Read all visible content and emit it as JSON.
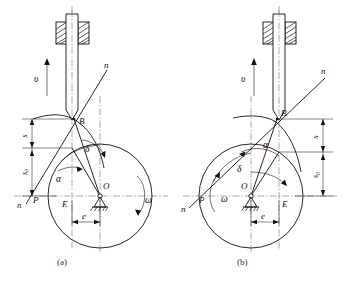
{
  "figure": {
    "background": "#ffffff",
    "line_color": "#111111",
    "centerline_color": "#555555"
  },
  "captions": {
    "a": "(a)",
    "b": "(b)"
  },
  "panels": [
    {
      "id": "a",
      "caption": "(a)",
      "offset_side": "left",
      "rotation_label": "ω",
      "rotation_direction": "clockwise",
      "labels": {
        "velocity": "υ",
        "normal_upper": "n",
        "normal_lower": "n",
        "contact_point": "B",
        "pitch_point": "P",
        "foot_point": "E",
        "center": "O",
        "eccentricity": "e",
        "pressure_angle": "α",
        "cam_angle": "δ",
        "displacement": "s",
        "initial_displacement": "s₀",
        "omega": "ω"
      }
    },
    {
      "id": "b",
      "caption": "(b)",
      "offset_side": "right",
      "rotation_label": "ω",
      "rotation_direction": "counterclockwise",
      "labels": {
        "velocity": "υ",
        "normal_upper": "n",
        "normal_lower": "n",
        "contact_point": "B",
        "pitch_point": "P",
        "foot_point": "E",
        "center": "O",
        "eccentricity": "e",
        "pressure_angle": "α",
        "cam_angle": "δ",
        "displacement": "s",
        "initial_displacement": "s₀",
        "omega": "ω"
      }
    }
  ],
  "components": {
    "follower_rod": "follower-rod",
    "guide_block_left": "guide-block-left",
    "guide_block_right": "guide-block-right",
    "cam_profile": "cam-profile-curve",
    "pitch_circle": "pitch-circle",
    "pivot": "fixed-pivot-support",
    "velocity_arrow": "velocity-arrow-up"
  }
}
